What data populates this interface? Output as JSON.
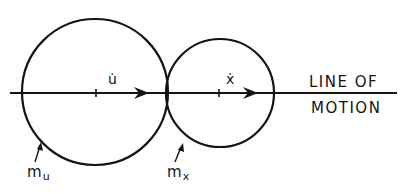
{
  "diagram": {
    "line_of_motion": {
      "label_line1": "LINE OF",
      "label_line2": "MOTION"
    },
    "bodies": [
      {
        "id": "u",
        "mass_label": "m",
        "mass_subscript": "u",
        "velocity_label": "u̇",
        "center": [
          95,
          92
        ],
        "radius": 73
      },
      {
        "id": "x",
        "mass_label": "m",
        "mass_subscript": "x",
        "velocity_label": "ẋ",
        "center": [
          220,
          93
        ],
        "radius": 54
      }
    ],
    "colors": {
      "stroke": "#141414",
      "background": "#ffffff"
    }
  }
}
